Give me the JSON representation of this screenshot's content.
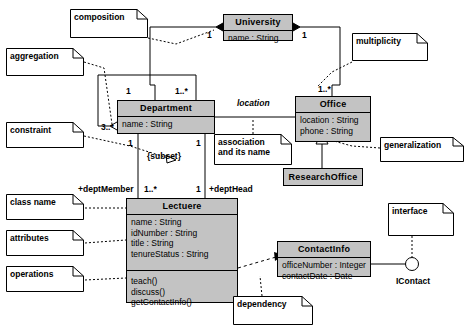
{
  "diagram": {
    "colors": {
      "class_fill": "#c3c3c3",
      "note_fill": "#ffffff",
      "line": "#000000",
      "background": "#ffffff"
    }
  },
  "classes": [
    {
      "id": "university",
      "name": "University",
      "attributes": [
        "name : String"
      ],
      "operations": []
    },
    {
      "id": "department",
      "name": "Department",
      "attributes": [
        "name : String"
      ],
      "operations": []
    },
    {
      "id": "office",
      "name": "Office",
      "attributes": [
        "location : String",
        "phone : String"
      ],
      "operations": []
    },
    {
      "id": "research-office",
      "name": "ResearchOffice",
      "attributes": [],
      "operations": []
    },
    {
      "id": "lecturer",
      "name": "Lectuere",
      "attributes": [
        "name : String",
        "idNumber : String",
        "title : String",
        "tenureStatus : String"
      ],
      "operations": [
        "teach()",
        "discuss()",
        "getContactInfo()"
      ]
    },
    {
      "id": "contact-info",
      "name": "ContactInfo",
      "attributes": [
        "officeNumber : Integer",
        "contactDate : Date"
      ],
      "operations": []
    }
  ],
  "notes": [
    {
      "id": "composition",
      "text": "composition"
    },
    {
      "id": "aggregation",
      "text": "aggregation"
    },
    {
      "id": "constraint",
      "text": "constraint"
    },
    {
      "id": "class-name",
      "text": "class name"
    },
    {
      "id": "attributes",
      "text": "attributes"
    },
    {
      "id": "operations",
      "text": "operations"
    },
    {
      "id": "multiplicity",
      "text": "multiplicity"
    },
    {
      "id": "generalization",
      "text": "generalization"
    },
    {
      "id": "interface",
      "text": "interface"
    },
    {
      "id": "dependency",
      "text": "dependency"
    },
    {
      "id": "association",
      "line1": "association",
      "line2": "and its name"
    }
  ],
  "labels": {
    "univ_left_mult": "1",
    "univ_right_mult": "1",
    "dept_top_mult": "1..*",
    "dept_self_one": "1",
    "dept_self_many": "3..*",
    "office_top_mult": "1..*",
    "association_name": "location",
    "dept_left_assoc_mult": "1",
    "dept_right_assoc_mult": "1",
    "subset_constraint": "{subset}",
    "dept_member_role": "+deptMember",
    "dept_member_mult": "1..*",
    "dept_head_mult": "1",
    "dept_head_role": "+deptHead",
    "interface_name": "IContact"
  }
}
